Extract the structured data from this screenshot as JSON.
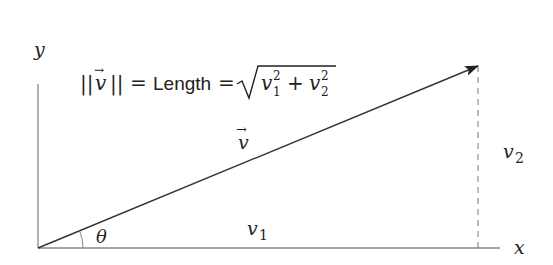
{
  "diagram": {
    "axes": {
      "x_label": "x",
      "y_label": "y"
    },
    "vector": {
      "label": "v",
      "arrow_accent": "→"
    },
    "components": {
      "horizontal": {
        "base": "v",
        "sub": "1"
      },
      "vertical": {
        "base": "v",
        "sub": "2"
      }
    },
    "angle_label": "θ",
    "formula": {
      "norm_open": "||",
      "norm_vec": "v",
      "norm_close": "||",
      "equals1": "=",
      "word": "Length",
      "equals2": "=",
      "term1_base": "v",
      "term1_sub": "1",
      "term1_sup": "2",
      "plus": "+",
      "term2_base": "v",
      "term2_sub": "2",
      "term2_sup": "2"
    },
    "colors": {
      "axis": "#888888",
      "vector": "#333333",
      "dashed": "#777777",
      "text": "#222222"
    }
  }
}
